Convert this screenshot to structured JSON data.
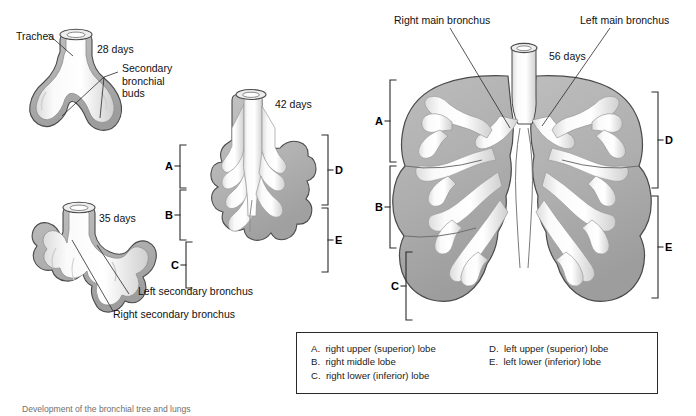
{
  "figure": {
    "title": "Development of the bronchial tree and lungs",
    "caption": "Development of the bronchial tree and lungs"
  },
  "stages": [
    {
      "id": "stage-28",
      "day_label": "28 days"
    },
    {
      "id": "stage-35",
      "day_label": "35 days"
    },
    {
      "id": "stage-42",
      "day_label": "42 days"
    },
    {
      "id": "stage-56",
      "day_label": "56 days"
    }
  ],
  "annotations": {
    "trachea": "Trachea",
    "secondary_bronchial_buds_l1": "Secondary",
    "secondary_bronchial_buds_l2": "bronchial",
    "secondary_bronchial_buds_l3": "buds",
    "left_secondary_bronchus": "Left secondary bronchus",
    "right_secondary_bronchus": "Right secondary bronchus",
    "right_main_bronchus": "Right main bronchus",
    "left_main_bronchus": "Left main bronchus"
  },
  "brackets": {
    "a": "A",
    "b": "B",
    "c": "C",
    "d": "D",
    "e": "E"
  },
  "legend": {
    "left_column": "A.  right upper (superior) lobe\nB.  right middle lobe\nC.  right lower (inferior) lobe",
    "right_column": "D.  left upper (superior) lobe\nE.  left lower (inferior) lobe",
    "items": [
      {
        "key": "A",
        "label": "right upper (superior) lobe"
      },
      {
        "key": "B",
        "label": "right middle lobe"
      },
      {
        "key": "C",
        "label": "right lower (inferior) lobe"
      },
      {
        "key": "D",
        "label": "left upper (superior) lobe"
      },
      {
        "key": "E",
        "label": "left lower (inferior) lobe"
      }
    ]
  },
  "colors": {
    "mesenchyme": "#b0b0b0",
    "mesenchyme_dark": "#9a9a9a",
    "airway_lumen": "#fbfbfb",
    "airway_shadow": "#d8d8d8",
    "outline": "#3d3d3d",
    "leader_line": "#2b2b2b",
    "text": "#1a1a1a",
    "legend_border": "#2a2a2a",
    "background": "#ffffff"
  }
}
